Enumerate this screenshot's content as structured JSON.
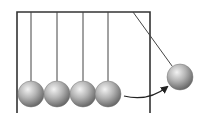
{
  "diagram": {
    "colors": {
      "background": "#ffffff",
      "frame": "#333333",
      "string": "#444444",
      "ball_highlight": "#f2f2f2",
      "ball_mid": "#a8a8a8",
      "ball_shadow": "#5a5a5a",
      "arrow": "#222222"
    },
    "frame": {
      "left": 17,
      "right": 150,
      "top": 12,
      "bottom": 113
    },
    "ball_radius": 13,
    "resting_balls": [
      {
        "anchor_x": 31,
        "cx": 31,
        "cy": 94
      },
      {
        "anchor_x": 57,
        "cx": 57,
        "cy": 94
      },
      {
        "anchor_x": 83,
        "cx": 83,
        "cy": 94
      },
      {
        "anchor_x": 108,
        "cx": 108,
        "cy": 94
      }
    ],
    "swinging_ball": {
      "anchor_x": 133,
      "anchor_y": 12,
      "cx": 180,
      "cy": 77
    },
    "motion_arrow": {
      "start": [
        124,
        96
      ],
      "control": [
        148,
        102
      ],
      "end": [
        167,
        87
      ]
    }
  }
}
